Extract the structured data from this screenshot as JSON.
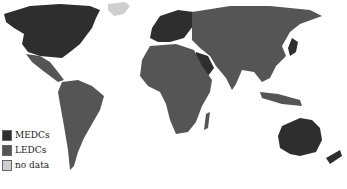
{
  "map": {
    "type": "choropleth world map",
    "colors": {
      "medc": "#2e2e2e",
      "ledc": "#555555",
      "no_data": "#cfcfcf",
      "background": "#ffffff"
    }
  },
  "legend": {
    "items": [
      {
        "label": "MEDCs",
        "color": "#2e2e2e"
      },
      {
        "label": "LEDCs",
        "color": "#555555"
      },
      {
        "label": "no data",
        "color": "#cfcfcf"
      }
    ]
  }
}
